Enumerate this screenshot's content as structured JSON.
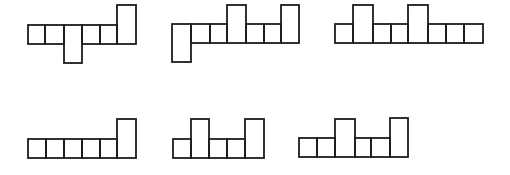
{
  "diagram": {
    "stroke_color": "#1c1c1c",
    "figures": [
      {
        "id": "figure-1",
        "cells": [
          {
            "x": 28,
            "y": 25,
            "w": 17,
            "h": 19
          },
          {
            "x": 45,
            "y": 25,
            "w": 19,
            "h": 19
          },
          {
            "x": 64,
            "y": 25,
            "w": 18,
            "h": 38
          },
          {
            "x": 82,
            "y": 25,
            "w": 18,
            "h": 19
          },
          {
            "x": 100,
            "y": 25,
            "w": 17,
            "h": 19
          },
          {
            "x": 117,
            "y": 5,
            "w": 19,
            "h": 39
          }
        ]
      },
      {
        "id": "figure-2",
        "cells": [
          {
            "x": 172,
            "y": 24,
            "w": 19,
            "h": 38
          },
          {
            "x": 191,
            "y": 24,
            "w": 19,
            "h": 19
          },
          {
            "x": 210,
            "y": 24,
            "w": 17,
            "h": 19
          },
          {
            "x": 227,
            "y": 5,
            "w": 19,
            "h": 38
          },
          {
            "x": 246,
            "y": 24,
            "w": 18,
            "h": 19
          },
          {
            "x": 264,
            "y": 24,
            "w": 17,
            "h": 19
          },
          {
            "x": 281,
            "y": 5,
            "w": 18,
            "h": 38
          }
        ]
      },
      {
        "id": "figure-3",
        "cells": [
          {
            "x": 335,
            "y": 24,
            "w": 18,
            "h": 19
          },
          {
            "x": 353,
            "y": 5,
            "w": 20,
            "h": 38
          },
          {
            "x": 373,
            "y": 24,
            "w": 18,
            "h": 19
          },
          {
            "x": 391,
            "y": 24,
            "w": 17,
            "h": 19
          },
          {
            "x": 408,
            "y": 5,
            "w": 20,
            "h": 38
          },
          {
            "x": 428,
            "y": 24,
            "w": 18,
            "h": 19
          },
          {
            "x": 446,
            "y": 24,
            "w": 18,
            "h": 19
          },
          {
            "x": 464,
            "y": 24,
            "w": 19,
            "h": 19
          }
        ]
      },
      {
        "id": "figure-4",
        "cells": [
          {
            "x": 28,
            "y": 139,
            "w": 18,
            "h": 19
          },
          {
            "x": 46,
            "y": 139,
            "w": 18,
            "h": 19
          },
          {
            "x": 64,
            "y": 139,
            "w": 18,
            "h": 19
          },
          {
            "x": 82,
            "y": 139,
            "w": 18,
            "h": 19
          },
          {
            "x": 100,
            "y": 139,
            "w": 17,
            "h": 19
          },
          {
            "x": 117,
            "y": 119,
            "w": 19,
            "h": 39
          }
        ]
      },
      {
        "id": "figure-5",
        "cells": [
          {
            "x": 173,
            "y": 139,
            "w": 18,
            "h": 19
          },
          {
            "x": 191,
            "y": 119,
            "w": 18,
            "h": 39
          },
          {
            "x": 209,
            "y": 139,
            "w": 18,
            "h": 19
          },
          {
            "x": 227,
            "y": 139,
            "w": 18,
            "h": 19
          },
          {
            "x": 245,
            "y": 119,
            "w": 19,
            "h": 39
          }
        ]
      },
      {
        "id": "figure-6",
        "cells": [
          {
            "x": 299,
            "y": 138,
            "w": 18,
            "h": 19
          },
          {
            "x": 317,
            "y": 138,
            "w": 18,
            "h": 19
          },
          {
            "x": 335,
            "y": 119,
            "w": 20,
            "h": 38
          },
          {
            "x": 355,
            "y": 138,
            "w": 16,
            "h": 19
          },
          {
            "x": 371,
            "y": 138,
            "w": 19,
            "h": 19
          },
          {
            "x": 390,
            "y": 118,
            "w": 18,
            "h": 39
          }
        ]
      }
    ]
  }
}
